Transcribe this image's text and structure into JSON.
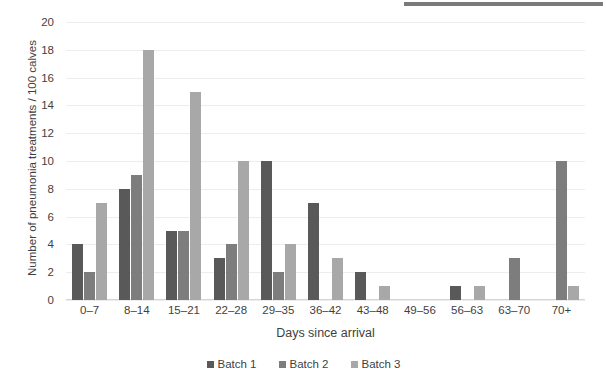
{
  "chart_data": {
    "type": "bar",
    "title": "",
    "xlabel": "Days since arrival",
    "ylabel": "Number of pneumonia treatments / 100 calves",
    "ylim": [
      0,
      20
    ],
    "ytick_step": 2,
    "yticks": [
      20,
      18,
      16,
      14,
      12,
      10,
      8,
      6,
      4,
      2,
      0
    ],
    "grid": "horizontal",
    "legend_position": "bottom-center",
    "categories": [
      "0–7",
      "8–14",
      "15–21",
      "22–28",
      "29–35",
      "36–42",
      "43–48",
      "49–56",
      "56–63",
      "63–70",
      "70+"
    ],
    "series": [
      {
        "name": "Batch 1",
        "color": "#595959",
        "values": [
          4,
          8,
          5,
          3,
          10,
          7,
          2,
          0,
          1,
          0,
          0
        ]
      },
      {
        "name": "Batch 2",
        "color": "#7d7d7d",
        "values": [
          2,
          9,
          5,
          4,
          2,
          0,
          0,
          0,
          0,
          3,
          10
        ]
      },
      {
        "name": "Batch 3",
        "color": "#a8a8a8",
        "values": [
          7,
          18,
          15,
          10,
          4,
          3,
          1,
          0,
          1,
          0,
          1
        ]
      }
    ]
  },
  "legend": {
    "items": [
      {
        "label": "Batch 1"
      },
      {
        "label": "Batch 2"
      },
      {
        "label": "Batch 3"
      }
    ]
  }
}
